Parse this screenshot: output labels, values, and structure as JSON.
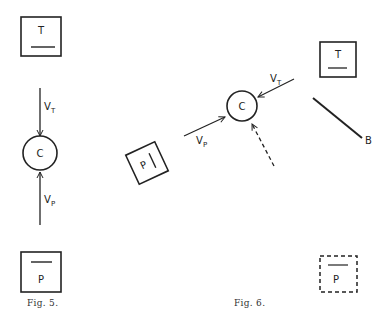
{
  "figures": [
    {
      "caption": "Fig. 5.",
      "labels": {
        "top_box": "T",
        "bottom_box": "P",
        "circle": "C",
        "arrow_top": "V",
        "arrow_top_sub": "T",
        "arrow_bottom": "V",
        "arrow_bottom_sub": "P"
      }
    },
    {
      "caption": "Fig. 6.",
      "labels": {
        "top_box": "T",
        "rotated_box": "P",
        "dashed_box": "P",
        "circle": "C",
        "arrow_t": "V",
        "arrow_t_sub": "T",
        "arrow_p": "V",
        "arrow_p_sub": "P",
        "line_end": "B"
      }
    }
  ],
  "colors": {
    "ink": "#222222",
    "paper": "#ffffff"
  }
}
